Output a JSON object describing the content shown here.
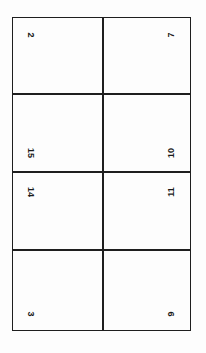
{
  "document": {
    "type": "imposition-grid",
    "columns": 2,
    "rows": 4,
    "line_color": "#1e1e1e",
    "panels": [
      {
        "row": 1,
        "col": 1,
        "number": "2"
      },
      {
        "row": 1,
        "col": 2,
        "number": "7"
      },
      {
        "row": 2,
        "col": 1,
        "number": "15"
      },
      {
        "row": 2,
        "col": 2,
        "number": "10"
      },
      {
        "row": 3,
        "col": 1,
        "number": "14"
      },
      {
        "row": 3,
        "col": 2,
        "number": "11"
      },
      {
        "row": 4,
        "col": 1,
        "number": "3"
      },
      {
        "row": 4,
        "col": 2,
        "number": "9"
      }
    ]
  }
}
